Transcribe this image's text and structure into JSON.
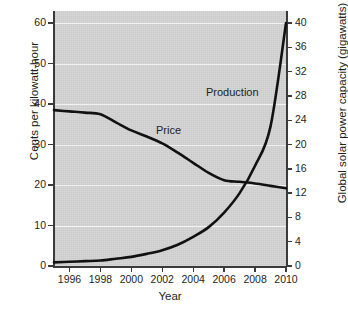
{
  "chart_data": {
    "type": "line",
    "title": "",
    "xlabel": "Year",
    "ylabel": "Cents per kilowatt-hour",
    "ylabel_right": "Global solar power capacity (gigawatts)",
    "xlim": [
      1995,
      2010
    ],
    "ylim": [
      0,
      63
    ],
    "ylim_right": [
      0,
      42
    ],
    "grid": "horizontal-white",
    "legend": "inline-annotations",
    "x_ticks": [
      1996,
      1998,
      2000,
      2002,
      2004,
      2006,
      2008,
      2010
    ],
    "y_ticks_left": [
      0,
      10,
      20,
      30,
      40,
      50,
      60
    ],
    "y_ticks_right": [
      0,
      4,
      8,
      12,
      16,
      20,
      24,
      28,
      32,
      36,
      40
    ],
    "series": [
      {
        "name": "Price",
        "axis": "left",
        "units": "cents per kilowatt-hour",
        "annotation": "Price",
        "x": [
          1995,
          1996,
          1997,
          1998,
          1999,
          2000,
          2001,
          2002,
          2003,
          2004,
          2005,
          2006,
          2007,
          2008,
          2009,
          2010
        ],
        "values": [
          38.5,
          38.2,
          37.9,
          37.5,
          35.5,
          33.5,
          32.0,
          30.3,
          28.0,
          25.5,
          23.0,
          21.2,
          20.8,
          20.4,
          19.8,
          19.2
        ]
      },
      {
        "name": "Production",
        "axis": "right",
        "units": "gigawatts",
        "annotation": "Production",
        "x": [
          1995,
          1996,
          1997,
          1998,
          1999,
          2000,
          2001,
          2002,
          2003,
          2004,
          2005,
          2006,
          2007,
          2008,
          2009,
          2010
        ],
        "values": [
          0.6,
          0.7,
          0.8,
          0.9,
          1.2,
          1.5,
          2.0,
          2.6,
          3.5,
          4.8,
          6.4,
          8.8,
          12.0,
          16.5,
          23.0,
          40.0
        ]
      }
    ]
  },
  "axes": {
    "left": {
      "title": "Cents per kilowatt-hour",
      "ticks": [
        "0",
        "10",
        "20",
        "30",
        "40",
        "50",
        "60"
      ]
    },
    "right": {
      "title": "Global solar power capacity (gigawatts)",
      "ticks": [
        "0",
        "4",
        "8",
        "12",
        "16",
        "20",
        "24",
        "28",
        "32",
        "36",
        "40"
      ]
    },
    "bottom": {
      "title": "Year",
      "ticks": [
        "1996",
        "1998",
        "2000",
        "2002",
        "2004",
        "2006",
        "2008",
        "2010"
      ]
    }
  },
  "annotations": {
    "price": "Price",
    "production": "Production"
  },
  "colors": {
    "plot_background": "#d3d3d3",
    "gridline": "#f2f2f2",
    "axis": "#3b3b3b",
    "line": "#111111",
    "text": "#231f20",
    "page_background": "#ffffff"
  }
}
